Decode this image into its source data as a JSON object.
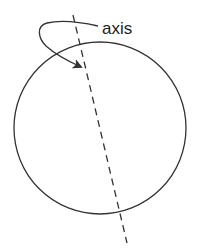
{
  "diagram": {
    "label": "axis",
    "colors": {
      "stroke": "#333333",
      "text": "#222222",
      "background": "#ffffff"
    },
    "elements": {
      "sphere": {
        "shape": "circle",
        "cx": 100,
        "cy": 128,
        "r": 86
      },
      "rotation_axis": {
        "style": "dashed",
        "x1": 73,
        "y1": 15,
        "x2": 127,
        "y2": 243
      },
      "rotation_arrow": {
        "style": "curved-arrow",
        "points_to": "rotation_axis"
      }
    }
  }
}
